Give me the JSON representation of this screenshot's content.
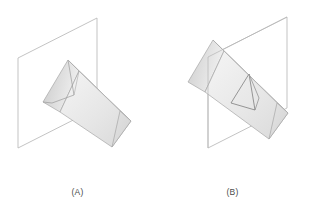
{
  "figure": {
    "type": "geometry-diagram",
    "background_color": "#ffffff",
    "panels": [
      {
        "id": "A",
        "label": "(A)",
        "caption_color": "#4b4b4b",
        "plane": {
          "name": "vertical-plane",
          "shape": "parallelogram",
          "stroke": "#b9b9b9",
          "fill": "none",
          "fill_opacity": 0
        },
        "solid": {
          "name": "triangular-prism",
          "faces": [
            {
              "name": "prism-left-face",
              "fill": "#d6d6d6"
            },
            {
              "name": "prism-top-face",
              "fill": "#ececec"
            },
            {
              "name": "prism-front-face",
              "fill": "#e4e4e4"
            },
            {
              "name": "prism-end-triangle",
              "fill": "#dcdcdc"
            }
          ],
          "edge_stroke": "#9a9a9a",
          "hidden_edge_stroke": "#8d8d8d"
        }
      },
      {
        "id": "B",
        "label": "(B)",
        "caption_color": "#4b4b4b",
        "plane": {
          "name": "vertical-plane",
          "shape": "parallelogram",
          "stroke": "#b9b9b9",
          "fill": "none",
          "fill_opacity": 0
        },
        "solid": {
          "name": "triangular-prism",
          "faces": [
            {
              "name": "prism-left-face",
              "fill": "#d6d6d6"
            },
            {
              "name": "prism-top-face",
              "fill": "#ececec"
            },
            {
              "name": "prism-front-face",
              "fill": "#e4e4e4"
            },
            {
              "name": "prism-end-triangle",
              "fill": "#dcdcdc"
            }
          ],
          "edge_stroke": "#9a9a9a",
          "cross_section": {
            "name": "triangular-cross-section",
            "stroke": "#7b7b7b",
            "fill": "none"
          }
        }
      }
    ]
  },
  "labels": {
    "panel_a": "(A)",
    "panel_b": "(B)"
  },
  "colors": {
    "plane_stroke": "#b9b9b9",
    "prism_edge": "#9a9a9a",
    "prism_light": "#f2f2f2",
    "prism_mid": "#e2e2e2",
    "prism_dark": "#cfcfcf",
    "caption": "#4b4b4b",
    "background": "#ffffff"
  }
}
